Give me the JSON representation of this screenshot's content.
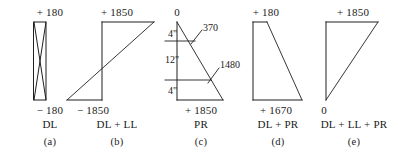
{
  "figure": {
    "type": "engineering-moment-diagrams",
    "panels": [
      {
        "id": "a",
        "caption": "(a)",
        "load_case": "DL",
        "top_value": "+ 180",
        "bottom_value": "− 180",
        "shape": "bowtie"
      },
      {
        "id": "b",
        "caption": "(b)",
        "load_case": "DL + LL",
        "top_value": "+ 1850",
        "bottom_value": "− 1850",
        "shape": "z-parallelogram"
      },
      {
        "id": "c",
        "caption": "(c)",
        "load_case": "PR",
        "top_value": "0",
        "bottom_value": "+ 1850",
        "shape": "right-triangle-with-dimensions",
        "dimensions": [
          {
            "label": "4\"",
            "position": "upper"
          },
          {
            "label": "12\"",
            "position": "middle"
          },
          {
            "label": "4\"",
            "position": "lower"
          }
        ],
        "annotations": [
          {
            "label": "370",
            "position": "upper-right"
          },
          {
            "label": "1480",
            "position": "lower-right"
          }
        ]
      },
      {
        "id": "d",
        "caption": "(d)",
        "load_case": "DL + PR",
        "top_value": "+ 180",
        "bottom_value": "+ 1670",
        "shape": "right-triangle-left-vertical"
      },
      {
        "id": "e",
        "caption": "(e)",
        "load_case": "DL + LL + PR",
        "top_value": "+ 1850",
        "bottom_value": "0",
        "shape": "right-triangle-left-vertical"
      }
    ],
    "colors": {
      "background": "#ffffff",
      "stroke": "#1f1f1f",
      "text": "#1a1a1a"
    }
  }
}
